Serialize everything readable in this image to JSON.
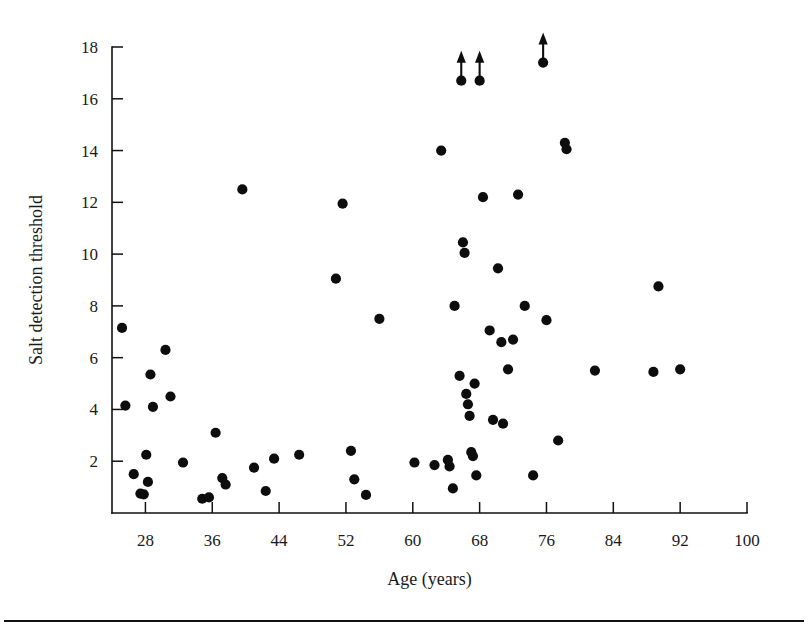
{
  "chart_data": {
    "type": "scatter",
    "title": "",
    "xlabel": "Age (years)",
    "ylabel": "Salt detection threshold",
    "xlim": [
      24,
      100
    ],
    "ylim": [
      0,
      18.6
    ],
    "xticks": [
      28,
      36,
      44,
      52,
      60,
      68,
      76,
      84,
      92,
      100
    ],
    "xtick_labels": [
      "28",
      "36",
      "44",
      "52",
      "60",
      "68",
      "76",
      "84",
      "92",
      "100"
    ],
    "yticks": [
      2,
      4,
      6,
      8,
      10,
      12,
      14,
      16,
      18
    ],
    "ytick_labels": [
      "2",
      "4",
      "6",
      "8",
      "10",
      "12",
      "14",
      "16",
      "18"
    ],
    "grid": false,
    "legend": null,
    "marker": "filled-circle",
    "marker_color": "#0d0d0d",
    "points": [
      [
        25.2,
        7.15
      ],
      [
        25.6,
        4.15
      ],
      [
        26.6,
        1.5
      ],
      [
        27.4,
        0.75
      ],
      [
        27.8,
        0.72
      ],
      [
        28.1,
        2.25
      ],
      [
        28.3,
        1.2
      ],
      [
        28.6,
        5.35
      ],
      [
        28.9,
        4.1
      ],
      [
        30.4,
        6.3
      ],
      [
        31.0,
        4.5
      ],
      [
        32.5,
        1.95
      ],
      [
        34.8,
        0.55
      ],
      [
        35.6,
        0.6
      ],
      [
        36.4,
        3.1
      ],
      [
        37.2,
        1.35
      ],
      [
        37.6,
        1.1
      ],
      [
        39.6,
        12.5
      ],
      [
        41.0,
        1.75
      ],
      [
        42.4,
        0.85
      ],
      [
        43.4,
        2.1
      ],
      [
        46.4,
        2.25
      ],
      [
        50.8,
        9.05
      ],
      [
        51.6,
        11.95
      ],
      [
        52.6,
        2.4
      ],
      [
        53.0,
        1.3
      ],
      [
        54.4,
        0.7
      ],
      [
        56.0,
        7.5
      ],
      [
        60.2,
        1.95
      ],
      [
        62.6,
        1.85
      ],
      [
        63.4,
        14.0
      ],
      [
        64.2,
        2.05
      ],
      [
        64.4,
        1.8
      ],
      [
        64.8,
        0.95
      ],
      [
        65.0,
        8.0
      ],
      [
        65.6,
        5.3
      ],
      [
        65.8,
        16.7
      ],
      [
        66.0,
        10.45
      ],
      [
        66.2,
        10.05
      ],
      [
        66.4,
        4.6
      ],
      [
        66.6,
        4.2
      ],
      [
        66.8,
        3.75
      ],
      [
        67.0,
        2.35
      ],
      [
        67.2,
        2.2
      ],
      [
        67.4,
        5.0
      ],
      [
        67.6,
        1.45
      ],
      [
        68.0,
        16.7
      ],
      [
        68.4,
        12.2
      ],
      [
        69.2,
        7.05
      ],
      [
        69.6,
        3.6
      ],
      [
        70.2,
        9.45
      ],
      [
        70.6,
        6.6
      ],
      [
        70.8,
        3.45
      ],
      [
        71.4,
        5.55
      ],
      [
        72.0,
        6.7
      ],
      [
        72.6,
        12.3
      ],
      [
        73.4,
        8.0
      ],
      [
        74.4,
        1.45
      ],
      [
        75.6,
        17.4
      ],
      [
        76.0,
        7.45
      ],
      [
        77.4,
        2.8
      ],
      [
        78.2,
        14.3
      ],
      [
        78.4,
        14.05
      ],
      [
        81.8,
        5.5
      ],
      [
        88.8,
        5.45
      ],
      [
        89.4,
        8.75
      ],
      [
        92.0,
        5.55
      ]
    ],
    "censored_points": [
      {
        "x": 65.8,
        "y": 16.7,
        "note": "value exceeds axis range"
      },
      {
        "x": 68.0,
        "y": 16.7,
        "note": "value exceeds axis range"
      },
      {
        "x": 75.6,
        "y": 17.4,
        "note": "value exceeds axis range"
      }
    ]
  },
  "figure": {
    "caption": ""
  }
}
